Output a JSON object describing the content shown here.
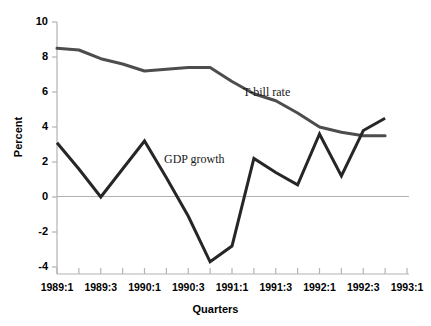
{
  "chart_data": {
    "type": "line",
    "title": "",
    "xlabel": "Quarters",
    "ylabel": "Percent",
    "ylim": [
      -4,
      10
    ],
    "yticks": [
      10,
      8,
      6,
      4,
      2,
      0,
      -2,
      -4
    ],
    "ytick_labels": [
      "10",
      "8",
      "6",
      "4",
      "2",
      "0",
      "-2",
      "-4"
    ],
    "xlim": [
      "1989:1",
      "1993:1"
    ],
    "x": [
      "1989:1",
      "1989:2",
      "1989:3",
      "1989:4",
      "1990:1",
      "1990:2",
      "1990:3",
      "1990:4",
      "1991:1",
      "1991:2",
      "1991:3",
      "1991:4",
      "1992:1",
      "1992:2",
      "1992:3",
      "1992:4",
      "1993:1"
    ],
    "xtick_labels": [
      "1989:1",
      "1989:3",
      "1990:1",
      "1990:3",
      "1991:1",
      "1991:3",
      "1992:1",
      "1992:3",
      "1993:1"
    ],
    "xtick_values": [
      "1989:1",
      "1989:3",
      "1990:1",
      "1990:3",
      "1991:1",
      "1991:3",
      "1992:1",
      "1992:3",
      "1993:1"
    ],
    "minor_ticks": true,
    "grid": false,
    "zero_line": true,
    "legend_position": "inline-annotation",
    "series": [
      {
        "name": "T-bill rate",
        "color": "#4d4d4d",
        "label_text": "T-bill rate",
        "values": [
          8.5,
          8.4,
          7.9,
          7.6,
          7.2,
          7.3,
          7.4,
          7.4,
          6.6,
          5.9,
          5.5,
          4.8,
          4.0,
          3.7,
          3.5,
          3.5,
          null
        ]
      },
      {
        "name": "GDP growth",
        "color": "#262626",
        "label_text": "GDP growth",
        "values": [
          3.1,
          1.6,
          0.0,
          1.6,
          3.2,
          1.1,
          -1.1,
          -3.7,
          -2.8,
          2.2,
          1.4,
          0.7,
          3.6,
          1.2,
          3.8,
          4.5,
          null
        ]
      }
    ],
    "annotations": [
      {
        "text": "T-bill rate",
        "x": "1991:1",
        "y": 6.2
      },
      {
        "text": "GDP growth",
        "x": "1990:2",
        "y": 2.5
      }
    ]
  },
  "axis": {
    "y_title": "Percent",
    "x_title": "Quarters"
  }
}
